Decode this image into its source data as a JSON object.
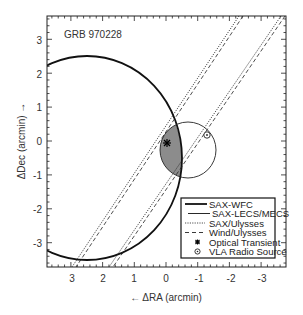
{
  "chart_data": {
    "type": "scatter",
    "title": "GRB 970228",
    "xlabel": "← ΔRA (arcmin)",
    "ylabel": "ΔDec (arcmin) →",
    "xlim": [
      3.6,
      -3.6
    ],
    "ylim": [
      -3.7,
      3.7
    ],
    "xticks": [
      "3",
      "2",
      "1",
      "0",
      "-1",
      "-2",
      "-3"
    ],
    "yticks": [
      "3",
      "2",
      "1",
      "0",
      "-1",
      "-2",
      "-3"
    ],
    "grid": false,
    "legend_position": "lower right",
    "series": [
      {
        "name": "SAX-WFC",
        "kind": "circle",
        "style": "thick solid",
        "center": [
          2.5,
          -0.5
        ],
        "radius": 3.0
      },
      {
        "name": "SAX-LECS/MECS",
        "kind": "circle",
        "style": "thin solid",
        "center": [
          -0.7,
          -0.3
        ],
        "radius": 0.85
      },
      {
        "name": "SAX/Ulysses",
        "kind": "annulus band",
        "style": "dotted",
        "edges": [
          [
            [
              -2.4,
              3.7
            ],
            [
              2.9,
              -3.7
            ]
          ],
          [
            [
              -3.6,
              3.7
            ],
            [
              1.7,
              -3.7
            ]
          ]
        ]
      },
      {
        "name": "Wind/Ulysses",
        "kind": "annulus band",
        "style": "dashed",
        "edges": [
          [
            [
              -2.5,
              3.7
            ],
            [
              2.8,
              -3.7
            ]
          ],
          [
            [
              -3.7,
              3.7
            ],
            [
              1.6,
              -3.7
            ]
          ]
        ]
      },
      {
        "name": "Optical Transient",
        "kind": "point",
        "marker": "asterisk",
        "x": -0.05,
        "y": -0.05
      },
      {
        "name": "VLA Radio Source",
        "kind": "point",
        "marker": "circled dot",
        "x": -1.3,
        "y": 0.2
      }
    ],
    "shaded_region": "intersection of SAX-WFC circle and SAX-LECS/MECS error circle (gray)"
  },
  "labels": {
    "title": "GRB 970228",
    "xlabel": "←  ΔRA (arcmin)",
    "ylabel": "ΔDec (arcmin)  →",
    "xticks": [
      "3",
      "2",
      "1",
      "0",
      "-1",
      "-2",
      "-3"
    ],
    "yticks": [
      "3",
      "2",
      "1",
      "0",
      "-1",
      "-2",
      "-3"
    ]
  },
  "legend": [
    "SAX-WFC",
    "SAX-LECS/MECS",
    "SAX/Ulysses",
    "Wind/Ulysses",
    "Optical Transient",
    "VLA Radio Source"
  ],
  "colors": {
    "ink": "#111111",
    "shade": "#8c8c8c"
  }
}
